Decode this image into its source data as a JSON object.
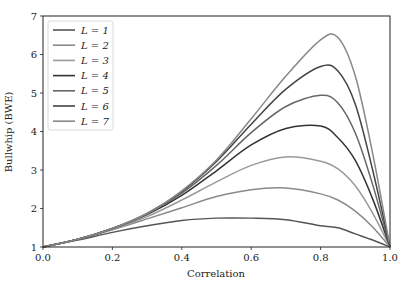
{
  "chart_data": {
    "type": "line",
    "title": "",
    "xlabel": "Correlation",
    "ylabel": "Bullwhip (BWE)",
    "xlim": [
      0.0,
      1.0
    ],
    "ylim": [
      1,
      7
    ],
    "xticks": [
      "0.0",
      "0.2",
      "0.4",
      "0.6",
      "0.8",
      "1.0"
    ],
    "yticks": [
      "1",
      "2",
      "3",
      "4",
      "5",
      "6",
      "7"
    ],
    "grid": false,
    "legend_position": "upper left",
    "x": [
      0.0,
      0.1,
      0.2,
      0.3,
      0.4,
      0.5,
      0.6,
      0.7,
      0.8,
      0.85,
      0.9,
      0.95,
      1.0
    ],
    "series": [
      {
        "name": "L = 1",
        "color": "#555555",
        "peak": {
          "x": 0.57,
          "y": 1.75
        },
        "values": [
          1.0,
          1.18,
          1.38,
          1.55,
          1.69,
          1.75,
          1.75,
          1.71,
          1.55,
          1.5,
          1.34,
          1.18,
          1.0
        ]
      },
      {
        "name": "L = 2",
        "color": "#8a8a8a",
        "peak": {
          "x": 0.68,
          "y": 2.53
        },
        "values": [
          1.0,
          1.2,
          1.45,
          1.73,
          2.02,
          2.31,
          2.49,
          2.53,
          2.38,
          2.22,
          1.93,
          1.52,
          1.0
        ]
      },
      {
        "name": "L = 3",
        "color": "#9a9a9a",
        "peak": {
          "x": 0.75,
          "y": 3.35
        },
        "values": [
          1.0,
          1.2,
          1.46,
          1.79,
          2.22,
          2.69,
          3.12,
          3.34,
          3.23,
          3.03,
          2.59,
          1.88,
          1.0
        ]
      },
      {
        "name": "L = 4",
        "color": "#333333",
        "peak": {
          "x": 0.79,
          "y": 4.15
        },
        "values": [
          1.0,
          1.2,
          1.48,
          1.84,
          2.34,
          2.98,
          3.65,
          4.08,
          4.14,
          3.84,
          3.25,
          2.25,
          1.0
        ]
      },
      {
        "name": "L = 5",
        "color": "#666666",
        "peak": {
          "x": 0.82,
          "y": 4.95
        },
        "values": [
          1.0,
          1.2,
          1.48,
          1.86,
          2.4,
          3.12,
          3.97,
          4.65,
          4.94,
          4.74,
          3.96,
          2.62,
          1.0
        ]
      },
      {
        "name": "L = 6",
        "color": "#444444",
        "peak": {
          "x": 0.84,
          "y": 5.75
        },
        "values": [
          1.0,
          1.2,
          1.48,
          1.87,
          2.44,
          3.22,
          4.19,
          5.1,
          5.69,
          5.57,
          4.71,
          3.0,
          1.0
        ]
      },
      {
        "name": "L = 7",
        "color": "#888888",
        "peak": {
          "x": 0.86,
          "y": 6.55
        },
        "values": [
          1.0,
          1.2,
          1.48,
          1.87,
          2.46,
          3.26,
          4.33,
          5.44,
          6.38,
          6.44,
          5.44,
          3.43,
          1.0
        ]
      }
    ]
  }
}
